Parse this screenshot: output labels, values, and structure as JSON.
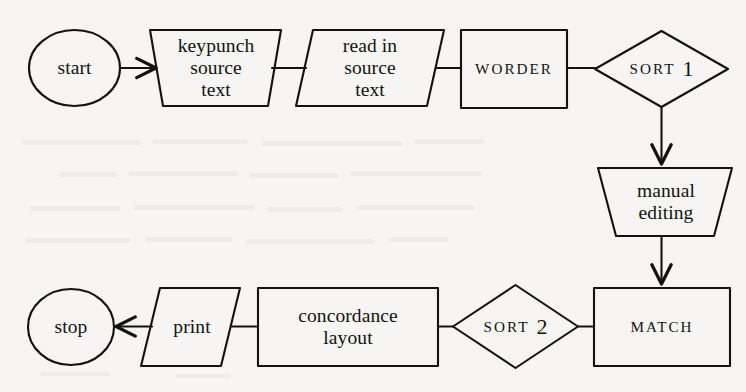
{
  "figure": {
    "kind": "flowchart",
    "orientation": "two-row, left-to-right then right-to-left",
    "ink_color": "#14120f",
    "paper_color": "#f6f5f3"
  },
  "nodes": {
    "start": {
      "label": "start",
      "shape": "circle"
    },
    "keypunch": {
      "label": "keypunch\nsource\ntext",
      "shape": "trapezoid-manual-input"
    },
    "read_in": {
      "label": "read in\nsource\ntext",
      "shape": "parallelogram-io"
    },
    "worder": {
      "label": "WORDER",
      "shape": "rectangle-process"
    },
    "sort1": {
      "label": "SORT",
      "number": "1",
      "shape": "diamond"
    },
    "manual_editing": {
      "label": "manual\nediting",
      "shape": "trapezoid-manual-operation"
    },
    "match": {
      "label": "MATCH",
      "shape": "rectangle-process"
    },
    "sort2": {
      "label": "SORT",
      "number": "2",
      "shape": "diamond"
    },
    "concordance": {
      "label": "concordance\nlayout",
      "shape": "rectangle-process"
    },
    "print": {
      "label": "print",
      "shape": "parallelogram-io"
    },
    "stop": {
      "label": "stop",
      "shape": "circle"
    }
  },
  "edges": [
    {
      "from": "start",
      "to": "keypunch",
      "arrow": true,
      "direction": "right"
    },
    {
      "from": "keypunch",
      "to": "read_in",
      "arrow": false,
      "direction": "right"
    },
    {
      "from": "read_in",
      "to": "worder",
      "arrow": false,
      "direction": "right"
    },
    {
      "from": "worder",
      "to": "sort1",
      "arrow": false,
      "direction": "right"
    },
    {
      "from": "sort1",
      "to": "manual_editing",
      "arrow": true,
      "direction": "down"
    },
    {
      "from": "manual_editing",
      "to": "match",
      "arrow": true,
      "direction": "down"
    },
    {
      "from": "match",
      "to": "sort2",
      "arrow": false,
      "direction": "left"
    },
    {
      "from": "sort2",
      "to": "concordance",
      "arrow": false,
      "direction": "left"
    },
    {
      "from": "concordance",
      "to": "print",
      "arrow": false,
      "direction": "left"
    },
    {
      "from": "print",
      "to": "stop",
      "arrow": true,
      "direction": "left"
    }
  ]
}
